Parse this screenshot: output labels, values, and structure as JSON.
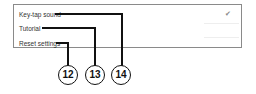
{
  "settings": {
    "items": [
      {
        "label": "Key-tap sound",
        "checked": true,
        "check_glyph": "✔"
      },
      {
        "label": "Tutorial"
      },
      {
        "label": "Reset settings"
      }
    ]
  },
  "callouts": [
    "12",
    "13",
    "14"
  ]
}
